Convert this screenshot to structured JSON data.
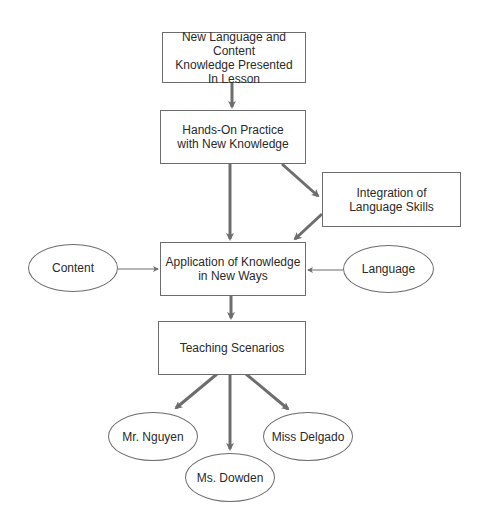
{
  "diagram": {
    "type": "flowchart",
    "nodes": {
      "new_knowledge": {
        "label": "New Language and Content\nKnowledge Presented\nIn Lesson",
        "shape": "rectangle"
      },
      "hands_on": {
        "label": "Hands-On Practice\nwith New Knowledge",
        "shape": "rectangle"
      },
      "integration": {
        "label": "Integration of\nLanguage Skills",
        "shape": "rectangle"
      },
      "application": {
        "label": "Application of Knowledge\nin New Ways",
        "shape": "rectangle"
      },
      "content": {
        "label": "Content",
        "shape": "ellipse"
      },
      "language": {
        "label": "Language",
        "shape": "ellipse"
      },
      "teaching": {
        "label": "Teaching Scenarios",
        "shape": "rectangle"
      },
      "nguyen": {
        "label": "Mr. Nguyen",
        "shape": "ellipse"
      },
      "dowden": {
        "label": "Ms. Dowden",
        "shape": "ellipse"
      },
      "delgado": {
        "label": "Miss Delgado",
        "shape": "ellipse"
      }
    },
    "edges": [
      {
        "from": "new_knowledge",
        "to": "hands_on"
      },
      {
        "from": "hands_on",
        "to": "application"
      },
      {
        "from": "hands_on",
        "to": "integration"
      },
      {
        "from": "integration",
        "to": "application"
      },
      {
        "from": "content",
        "to": "application"
      },
      {
        "from": "language",
        "to": "application"
      },
      {
        "from": "application",
        "to": "teaching"
      },
      {
        "from": "teaching",
        "to": "nguyen"
      },
      {
        "from": "teaching",
        "to": "dowden"
      },
      {
        "from": "teaching",
        "to": "delgado"
      }
    ],
    "colors": {
      "arrow": "#6d6d6d",
      "border": "#6d6d6d",
      "text": "#2a2a2a"
    }
  }
}
